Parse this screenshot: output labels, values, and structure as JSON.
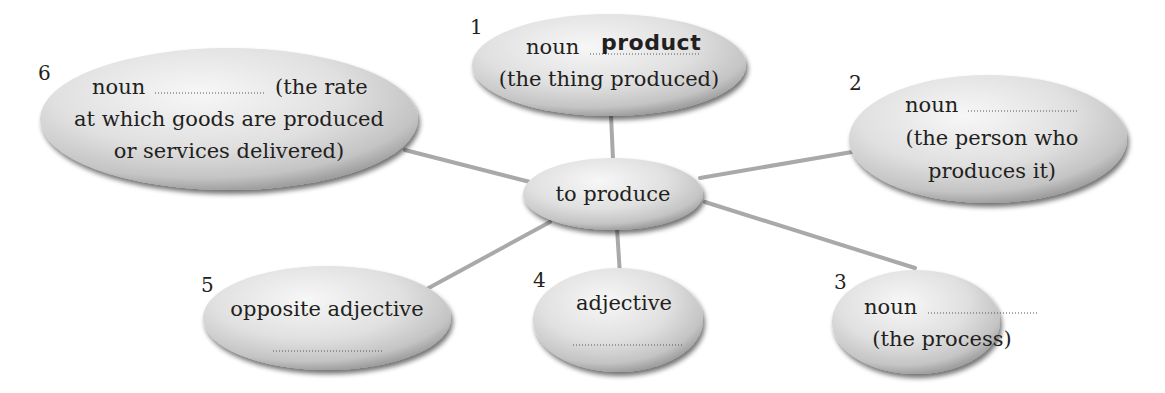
{
  "diagram": {
    "type": "word-family spider diagram",
    "center": {
      "label": "to produce"
    },
    "nodes": [
      {
        "number": "1",
        "line1_prefix": "noun",
        "answer": "product",
        "line2": "(the thing produced)"
      },
      {
        "number": "2",
        "line1_prefix": "noun",
        "answer": "",
        "line2": "(the person who",
        "line3": "produces it)"
      },
      {
        "number": "3",
        "line1_prefix": "noun",
        "answer": "",
        "line2": "(the process)"
      },
      {
        "number": "4",
        "line1": "adjective",
        "answer": ""
      },
      {
        "number": "5",
        "line1": "opposite adjective",
        "answer": ""
      },
      {
        "number": "6",
        "line1_prefix": "noun",
        "answer": "",
        "line1_suffix": "(the rate",
        "line2": "at which goods are produced",
        "line3": "or services delivered)"
      }
    ],
    "colors": {
      "bubble_fill_light": "#f4f4f4",
      "bubble_fill_mid": "#d6d6d6",
      "bubble_shadow": "#6e6e6e",
      "connector": "#a9a9a9",
      "text": "#231f20"
    }
  }
}
